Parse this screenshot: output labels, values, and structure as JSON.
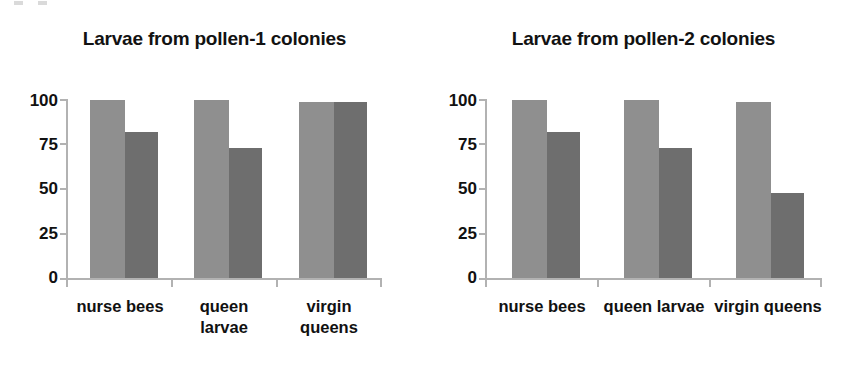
{
  "chart_data": [
    {
      "type": "bar",
      "title": "Larvae from pollen-1 colonies",
      "xlabel": "",
      "ylabel": "",
      "ylim": [
        0,
        100
      ],
      "yticks": [
        0,
        25,
        50,
        75,
        100
      ],
      "ytick_labels": [
        "0",
        "25",
        "50",
        "75",
        "100"
      ],
      "grid": false,
      "legend": "none",
      "categories": [
        "nurse bees",
        "queen larvae",
        "virgin queens"
      ],
      "category_label_lines": [
        [
          "nurse bees"
        ],
        [
          "queen",
          "larvae"
        ],
        [
          "virgin",
          "queens"
        ]
      ],
      "series": [
        {
          "name": "series-1",
          "color": "#8f8f8f",
          "values": [
            100,
            100,
            99
          ]
        },
        {
          "name": "series-2",
          "color": "#6e6e6e",
          "values": [
            82,
            73,
            99
          ]
        }
      ]
    },
    {
      "type": "bar",
      "title": "Larvae from pollen-2 colonies",
      "xlabel": "",
      "ylabel": "",
      "ylim": [
        0,
        100
      ],
      "yticks": [
        0,
        25,
        50,
        75,
        100
      ],
      "ytick_labels": [
        "0",
        "25",
        "50",
        "75",
        "100"
      ],
      "grid": false,
      "legend": "none",
      "categories": [
        "nurse bees",
        "queen larvae",
        "virgin queens"
      ],
      "category_label_lines": [
        [
          "nurse bees"
        ],
        [
          "queen larvae"
        ],
        [
          "virgin queens"
        ]
      ],
      "series": [
        {
          "name": "series-1",
          "color": "#8f8f8f",
          "values": [
            100,
            100,
            99
          ]
        },
        {
          "name": "series-2",
          "color": "#6e6e6e",
          "values": [
            82,
            73,
            48
          ]
        }
      ]
    }
  ],
  "panels": [
    {
      "title": "Larvae from pollen-1 colonies",
      "ytick_labels": [
        "100",
        "75",
        "50",
        "25",
        "0"
      ],
      "xtick_labels": [
        {
          "line1": "nurse bees",
          "line2": ""
        },
        {
          "line1": "queen",
          "line2": "larvae"
        },
        {
          "line1": "virgin",
          "line2": "queens"
        }
      ]
    },
    {
      "title": "Larvae from pollen-2 colonies",
      "ytick_labels": [
        "100",
        "75",
        "50",
        "25",
        "0"
      ],
      "xtick_labels": [
        {
          "line1": "nurse bees",
          "line2": ""
        },
        {
          "line1": "queen larvae",
          "line2": ""
        },
        {
          "line1": "virgin queens",
          "line2": ""
        }
      ]
    }
  ],
  "colors": {
    "series_light": "#8f8f8f",
    "series_dark": "#6e6e6e",
    "axis": "#b2b2b2",
    "text": "#111111",
    "background": "#ffffff"
  }
}
